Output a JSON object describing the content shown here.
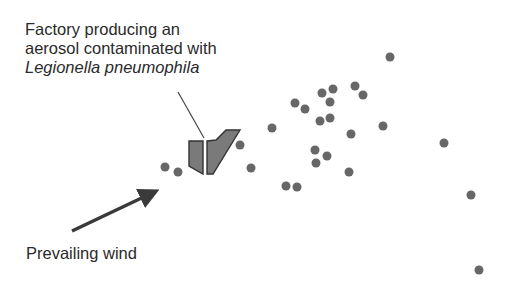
{
  "labels": {
    "factory_line1": "Factory producing an",
    "factory_line2": "aerosol contaminated with",
    "factory_line3": "Legionella pneumophila",
    "wind": "Prevailing wind"
  },
  "colors": {
    "dot": "#676767",
    "factory_fill": "#7a7a7a",
    "factory_stroke": "#333333",
    "arrow": "#3a3a3a",
    "leader": "#444444",
    "text": "#2a2a2a"
  },
  "case_points": [
    [
      165,
      167
    ],
    [
      178,
      172
    ],
    [
      240,
      145
    ],
    [
      251,
      168
    ],
    [
      272,
      128
    ],
    [
      286,
      186
    ],
    [
      297,
      187
    ],
    [
      295,
      103
    ],
    [
      305,
      109
    ],
    [
      322,
      93
    ],
    [
      333,
      89
    ],
    [
      330,
      102
    ],
    [
      320,
      121
    ],
    [
      330,
      118
    ],
    [
      315,
      150
    ],
    [
      327,
      156
    ],
    [
      316,
      163
    ],
    [
      349,
      172
    ],
    [
      351,
      134
    ],
    [
      355,
      86
    ],
    [
      363,
      95
    ],
    [
      383,
      126
    ],
    [
      390,
      57
    ],
    [
      444,
      143
    ],
    [
      471,
      195
    ],
    [
      479,
      270
    ]
  ],
  "dot_radius": 4.5
}
